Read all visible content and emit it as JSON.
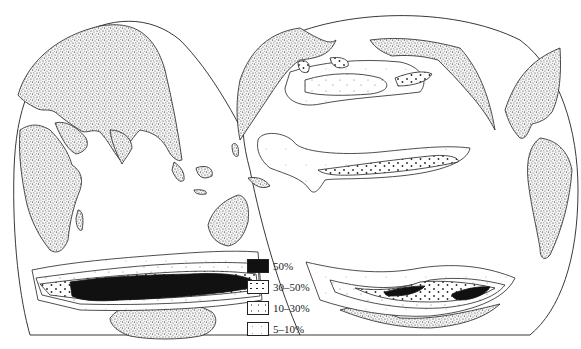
{
  "map": {
    "type": "interrupted world projection (two lobes) showing ocean concentration zones",
    "land_pattern": "stippled",
    "lobes": [
      {
        "name": "eastern-hemisphere-lobe",
        "regions": [
          "Europe",
          "Asia",
          "Africa",
          "Indian Ocean",
          "Australia",
          "Southern Ocean (Indian sector)"
        ]
      },
      {
        "name": "western-hemisphere-lobe",
        "regions": [
          "North Pacific",
          "North America",
          "South America",
          "South Pacific",
          "Southern Ocean (Pacific sector)"
        ]
      }
    ],
    "zones": [
      {
        "level": "50%",
        "locations": [
          "Southern Ocean band south of Africa/Indian Ocean",
          "two lenses in South Pacific Southern Ocean"
        ]
      },
      {
        "level": "30-50%",
        "locations": [
          "bands bordering the Southern Ocean 50% zone",
          "North Pacific subarctic patches",
          "equatorial Pacific tongue core"
        ]
      },
      {
        "level": "10-30%",
        "locations": [
          "Southern Ocean outer bands",
          "North Pacific",
          "equatorial Pacific tongue"
        ]
      },
      {
        "level": "5-10%",
        "locations": [
          "outer contours in Southern Ocean and North Pacific"
        ]
      }
    ]
  },
  "legend": {
    "items": [
      {
        "key": "s50",
        "label": "50%"
      },
      {
        "key": "s30",
        "label": "30–50%"
      },
      {
        "key": "s10",
        "label": "10–30%"
      },
      {
        "key": "s5",
        "label": "5–10%"
      }
    ]
  },
  "colors": {
    "ink": "#222222",
    "max_fill": "#111111",
    "background": "#ffffff"
  }
}
